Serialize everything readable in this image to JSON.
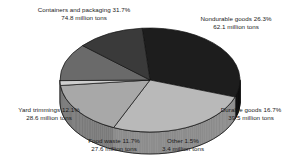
{
  "chart_data": {
    "type": "pie",
    "title": "",
    "subtitle": "",
    "xlabel": "",
    "ylabel": "",
    "legend_position": "none",
    "grid": false,
    "three_d": true,
    "unit": "million tons",
    "categories": [
      "Containers and packaging",
      "Nondurable goods",
      "Durable goods",
      "Other",
      "Food waste",
      "Yard trimmings"
    ],
    "percentages": [
      31.7,
      26.3,
      16.7,
      1.5,
      11.7,
      12.1
    ],
    "values": [
      74.8,
      62.1,
      39.5,
      3.4,
      27.6,
      28.6
    ],
    "colors": [
      "#1d1d1d",
      "#b9b9b9",
      "#a8a8a8",
      "#cfcfcf",
      "#6a6a6a",
      "#3a3a3a"
    ],
    "slices": [
      {
        "name": "Containers and packaging",
        "percent": 31.7,
        "value": 74.8,
        "color": "#1d1d1d",
        "side_color": "#0e0e0e"
      },
      {
        "name": "Nondurable goods",
        "percent": 26.3,
        "value": 62.1,
        "color": "#b9b9b9",
        "side_color": "#8d8d8d"
      },
      {
        "name": "Durable goods",
        "percent": 16.7,
        "value": 39.5,
        "color": "#a8a8a8",
        "side_color": "#7c7c7c"
      },
      {
        "name": "Other",
        "percent": 1.5,
        "value": 3.4,
        "color": "#cfcfcf",
        "side_color": "#9c9c9c"
      },
      {
        "name": "Food waste",
        "percent": 11.7,
        "value": 27.6,
        "color": "#6a6a6a",
        "side_color": "#4b4b4b"
      },
      {
        "name": "Yard trimmings",
        "percent": 12.1,
        "value": 28.6,
        "color": "#3a3a3a",
        "side_color": "#242424"
      }
    ]
  },
  "labels": {
    "containers": {
      "line1": "Containers and packaging 31.7%",
      "line2": "74.8 million tons"
    },
    "nondurable": {
      "line1": "Nondurable goods 26.3%",
      "line2": "62.1 million tons"
    },
    "durable": {
      "line1": "Durable goods 16.7%",
      "line2": "39.5 million tons"
    },
    "other": {
      "line1": "Other 1.5%",
      "line2": "3.4 million tons"
    },
    "foodwaste": {
      "line1": "Food waste 11.7%",
      "line2": "27.6 million tons"
    },
    "yard": {
      "line1": "Yard trimmings 12.1%",
      "line2": "28.6 million tons"
    }
  }
}
